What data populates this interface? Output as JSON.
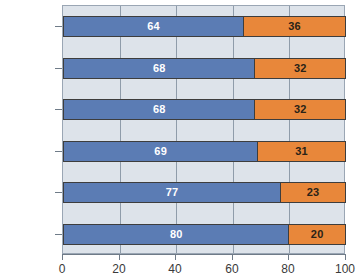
{
  "chart_data": {
    "type": "bar",
    "orientation": "horizontal",
    "stacked": true,
    "title": "",
    "xlabel": "",
    "ylabel": "",
    "xlim": [
      0,
      100
    ],
    "xticks": [
      0,
      20,
      40,
      60,
      80,
      100
    ],
    "xtick_labels": [
      "0",
      "20",
      "40",
      "60",
      "80",
      "100"
    ],
    "grid": true,
    "grid_axis": "x",
    "legend": "none",
    "categories": [
      "Computer",
      "Insurance",
      "Cable TV",
      "Cell",
      "Banking",
      "Catalog"
    ],
    "series": [
      {
        "name": "series-a",
        "color": "#5b7cb4",
        "label_color": "#ffffff",
        "values": [
          64,
          68,
          68,
          69,
          77,
          80
        ]
      },
      {
        "name": "series-b",
        "color": "#e8873a",
        "label_color": "#2a2317",
        "values": [
          36,
          32,
          32,
          31,
          23,
          20
        ]
      }
    ],
    "rows": [
      {
        "category": "Computer",
        "a": 64,
        "b": 36,
        "a_label": "64",
        "b_label": "36"
      },
      {
        "category": "Insurance",
        "a": 68,
        "b": 32,
        "a_label": "68",
        "b_label": "32"
      },
      {
        "category": "Cable TV",
        "a": 68,
        "b": 32,
        "a_label": "68",
        "b_label": "32"
      },
      {
        "category": "Cell",
        "a": 69,
        "b": 31,
        "a_label": "69",
        "b_label": "31"
      },
      {
        "category": "Banking",
        "a": 77,
        "b": 23,
        "a_label": "77",
        "b_label": "23"
      },
      {
        "category": "Catalog",
        "a": 80,
        "b": 20,
        "a_label": "80",
        "b_label": "20"
      }
    ],
    "colors": {
      "plot_background": "#dde3ea",
      "page_background": "#ffffff",
      "gridline": "#8f9caa",
      "axis": "#6f7b88",
      "bar_border": "#3d3d3d",
      "tick_text": "#3a3a3a"
    }
  }
}
